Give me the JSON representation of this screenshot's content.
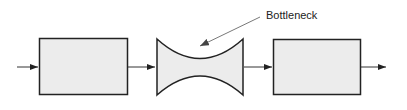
{
  "diagram": {
    "annotation": {
      "label": "Bottleneck"
    },
    "nodes": [
      {
        "id": "stage-1",
        "shape": "rectangle"
      },
      {
        "id": "bottleneck",
        "shape": "concave-hourglass"
      },
      {
        "id": "stage-3",
        "shape": "rectangle"
      }
    ],
    "edges": [
      {
        "from": "input",
        "to": "stage-1"
      },
      {
        "from": "stage-1",
        "to": "bottleneck"
      },
      {
        "from": "bottleneck",
        "to": "stage-3"
      },
      {
        "from": "stage-3",
        "to": "output"
      }
    ],
    "colors": {
      "fill": "#ececec",
      "stroke": "#222222",
      "leader": "#555555"
    }
  }
}
